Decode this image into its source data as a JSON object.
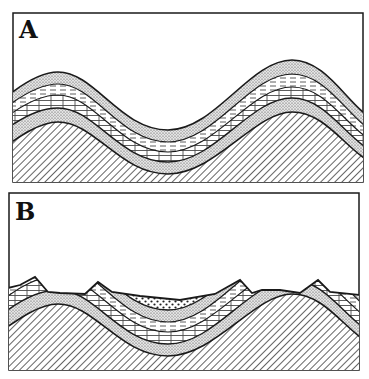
{
  "figure": {
    "panels": [
      {
        "id": "A",
        "label": "A",
        "description": "Folded sedimentary strata (anticlines and syncline) before erosion",
        "layers": [
          "sandstone (stippled)",
          "shale (dashed)",
          "limestone (brick)",
          "sandstone (stippled)",
          "basement (hatched)"
        ]
      },
      {
        "id": "B",
        "label": "B",
        "description": "Same folded strata after erosion, with ridges and valley infill",
        "layers": [
          "valley fill (coarse dots)",
          "sandstone (stippled)",
          "shale (dashed)",
          "limestone (brick)",
          "sandstone (stippled)",
          "basement (hatched)"
        ]
      }
    ],
    "colors": {
      "ink": "#1a1a1a",
      "paper": "#ffffff"
    }
  }
}
